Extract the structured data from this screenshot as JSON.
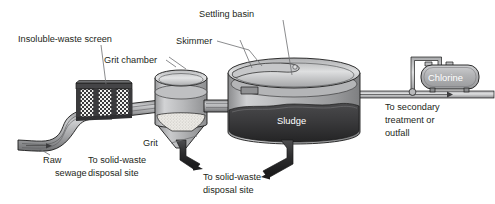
{
  "diagram": {
    "title_visible": false,
    "canvas": {
      "width": 495,
      "height": 204,
      "background": "#ffffff"
    }
  },
  "labels": {
    "insoluble_waste_screen": "Insoluble-waste screen",
    "grit_chamber": "Grit chamber",
    "skimmer": "Skimmer",
    "settling_basin": "Settling basin",
    "chlorine": "Chlorine",
    "sludge": "Sludge",
    "grit": "Grit",
    "raw_line1": "Raw",
    "raw_line2": "sewage",
    "solid_waste_a_line1": "To solid-waste",
    "solid_waste_a_line2": "disposal site",
    "solid_waste_b_line1": "To solid-waste",
    "solid_waste_b_line2": "disposal site",
    "outflow_line1": "To secondary",
    "outflow_line2": "treatment or",
    "outflow_line3": "outfall"
  },
  "components": [
    {
      "name": "raw-sewage-channel",
      "label": "Raw sewage",
      "role": "influent channel"
    },
    {
      "name": "insoluble-waste-screen",
      "label": "Insoluble-waste screen",
      "role": "bar screen with three mesh panels"
    },
    {
      "name": "grit-chamber",
      "label": "Grit chamber",
      "role": "settling tank with conical bottom and grit bed"
    },
    {
      "name": "settling-basin",
      "label": "Settling basin",
      "role": "large primary clarifier with sludge layer"
    },
    {
      "name": "skimmer",
      "label": "Skimmer",
      "role": "surface skimming arm"
    },
    {
      "name": "chlorine-tank",
      "label": "Chlorine",
      "role": "chlorination tank feeding the effluent pipe"
    }
  ],
  "flow": {
    "inlet": "Raw sewage",
    "outlet": "To secondary treatment or outfall",
    "waste_streams": [
      "To solid-waste disposal site",
      "To solid-waste disposal site"
    ]
  },
  "colors": {
    "text": "#231f20",
    "leader": "#6d6e71",
    "outline": "#1a1a1a",
    "water_light": "#c7c8ca",
    "water_mid": "#a7a9ac",
    "water_dark": "#808285",
    "sludge": "#3b3b3d",
    "grit": "#e8e6e1",
    "tank_face": "#b9babc",
    "tank_top": "#d4d5d7",
    "screen_frame": "#39393b",
    "chlorine_body": "#b4b5b7",
    "white": "#ffffff"
  }
}
